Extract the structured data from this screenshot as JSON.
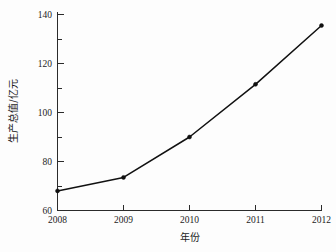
{
  "chart_data": {
    "type": "line",
    "title": "",
    "subtitle": "",
    "xlabel": "年份",
    "ylabel": "生产总值/亿元",
    "categories": [
      "2008",
      "2009",
      "2010",
      "2011",
      "2012"
    ],
    "x": [
      2008,
      2009,
      2010,
      2011,
      2012
    ],
    "values": [
      68,
      73.5,
      90,
      111.5,
      135.5
    ],
    "series": [
      {
        "name": "生产总值",
        "values": [
          68,
          73.5,
          90,
          111.5,
          135.5
        ]
      }
    ],
    "xlim": [
      2008,
      2012
    ],
    "ylim": [
      60,
      140
    ],
    "ytick_labels": [
      "60",
      "80",
      "100",
      "120",
      "140"
    ],
    "ytick_values": [
      60,
      80,
      100,
      120,
      140
    ],
    "yminor_values": [
      70,
      90,
      110,
      130
    ],
    "xtick_labels": [
      "2008",
      "2009",
      "2010",
      "2011",
      "2012"
    ],
    "grid": false,
    "legend": false,
    "legend_position": "none",
    "line_color": "#111111",
    "marker": "dot",
    "axis_color": "#2b2b2b",
    "background_color": "#fdfdfd"
  },
  "axes": {
    "y": {
      "label": "生产总值/亿元",
      "ticks": [
        {
          "value": 60,
          "label": "60"
        },
        {
          "value": 80,
          "label": "80"
        },
        {
          "value": 100,
          "label": "100"
        },
        {
          "value": 120,
          "label": "120"
        },
        {
          "value": 140,
          "label": "140"
        }
      ]
    },
    "x": {
      "label": "年份",
      "ticks": [
        {
          "value": 2008,
          "label": "2008"
        },
        {
          "value": 2009,
          "label": "2009"
        },
        {
          "value": 2010,
          "label": "2010"
        },
        {
          "value": 2011,
          "label": "2011"
        },
        {
          "value": 2012,
          "label": "2012"
        }
      ]
    }
  }
}
